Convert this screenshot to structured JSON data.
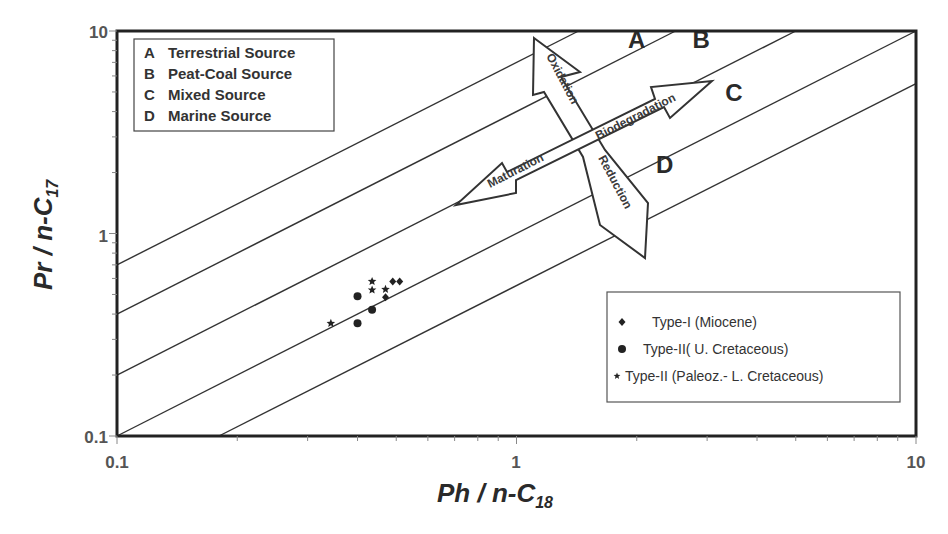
{
  "chart_data": {
    "type": "scatter",
    "title": "",
    "xlabel": "Ph / n-C18",
    "xlabel_main": "Ph / n-C",
    "xlabel_sub": "18",
    "ylabel": "Pr / n-C17",
    "ylabel_main": "Pr / n-C",
    "ylabel_sub": "17",
    "xscale": "log",
    "yscale": "log",
    "xlim": [
      0.1,
      10
    ],
    "ylim": [
      0.1,
      10
    ],
    "xticks": [
      "0.1",
      "1",
      "10"
    ],
    "yticks": [
      "0.1",
      "1",
      "10"
    ],
    "grid": false,
    "source_lines": [
      {
        "label": "k=7",
        "from": [
          0.1,
          0.7
        ],
        "to": [
          1.43,
          10
        ]
      },
      {
        "label": "k=4",
        "from": [
          0.1,
          0.4
        ],
        "to": [
          2.5,
          10
        ]
      },
      {
        "label": "k=2",
        "from": [
          0.1,
          0.2
        ],
        "to": [
          5.0,
          10
        ]
      },
      {
        "label": "k=1",
        "from": [
          0.1,
          0.1
        ],
        "to": [
          10,
          10
        ]
      },
      {
        "label": "k=0.55",
        "from": [
          0.18,
          0.1
        ],
        "to": [
          10,
          5.5
        ]
      }
    ],
    "zone_labels": [
      {
        "text": "A",
        "x": 2.0,
        "y": 8.2
      },
      {
        "text": "B",
        "x": 2.9,
        "y": 8.2
      },
      {
        "text": "C",
        "x": 3.5,
        "y": 4.5
      },
      {
        "text": "D",
        "x": 2.35,
        "y": 2.0
      }
    ],
    "process_arrows": [
      "Oxidation",
      "Reduction",
      "Biodegradation",
      "Maturation"
    ],
    "legend_sources": [
      {
        "key": "A",
        "label": "Terrestrial Source"
      },
      {
        "key": "B",
        "label": "Peat-Coal Source"
      },
      {
        "key": "C",
        "label": "Mixed Source"
      },
      {
        "key": "D",
        "label": "Marine Source"
      }
    ],
    "series": [
      {
        "name": "Type-I (Miocene)",
        "marker": "diamond",
        "points": [
          [
            0.49,
            0.58
          ],
          [
            0.51,
            0.58
          ],
          [
            0.47,
            0.485
          ]
        ]
      },
      {
        "name": "Type-II( U. Cretaceous)",
        "marker": "circle",
        "points": [
          [
            0.4,
            0.49
          ],
          [
            0.4,
            0.36
          ],
          [
            0.435,
            0.42
          ]
        ]
      },
      {
        "name": "Type-II (Paleoz.- L. Cretaceous)",
        "marker": "star",
        "points": [
          [
            0.343,
            0.36
          ],
          [
            0.435,
            0.58
          ],
          [
            0.435,
            0.526
          ],
          [
            0.47,
            0.53
          ]
        ]
      }
    ],
    "legend_position": "lower right (series), upper left (sources)"
  },
  "legend_sources_title": "",
  "legend_series": [
    {
      "label": "Type-I  (Miocene)"
    },
    {
      "label": "Type-II( U. Cretaceous)"
    },
    {
      "label": "Type-II (Paleoz.- L. Cretaceous)"
    }
  ]
}
